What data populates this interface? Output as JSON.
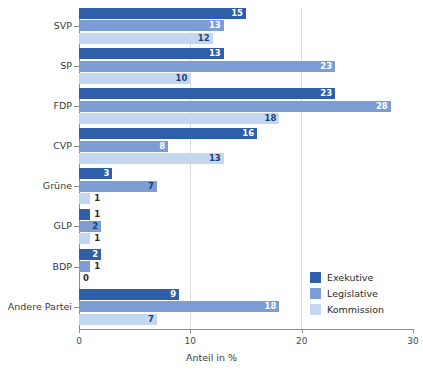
{
  "chart_data": {
    "type": "bar",
    "orientation": "horizontal",
    "title": "",
    "subtitle": "",
    "xlabel": "Anteil in %",
    "ylabel": "",
    "xlim": [
      0,
      30
    ],
    "xticks": [
      0,
      10,
      20,
      30
    ],
    "xtick_labels": [
      "0",
      "10",
      "20",
      "30"
    ],
    "grid": "vertical-gridlines-at-10-and-20",
    "legend_position": "bottom-right",
    "categories": [
      "SVP",
      "SP",
      "FDP",
      "CVP",
      "Grüne",
      "GLP",
      "BDP",
      "Andere Partei"
    ],
    "series": [
      {
        "name": "Exekutive",
        "color": "#2e5fa8",
        "values": [
          15,
          13,
          23,
          16,
          3,
          1,
          2,
          9
        ]
      },
      {
        "name": "Legislative",
        "color": "#7b9dd4",
        "values": [
          13,
          23,
          28,
          8,
          7,
          2,
          1,
          18
        ]
      },
      {
        "name": "Kommission",
        "color": "#c3d7f0",
        "values": [
          12,
          10,
          18,
          13,
          1,
          1,
          0,
          7
        ]
      }
    ]
  },
  "legend": {
    "items": [
      {
        "label": "Exekutive",
        "color": "#2e5fa8"
      },
      {
        "label": "Legislative",
        "color": "#7b9dd4"
      },
      {
        "label": "Kommission",
        "color": "#c3d7f0"
      }
    ]
  },
  "axis": {
    "x_title": "Anteil in %",
    "x_tick_labels": [
      "0",
      "10",
      "20",
      "30"
    ]
  }
}
